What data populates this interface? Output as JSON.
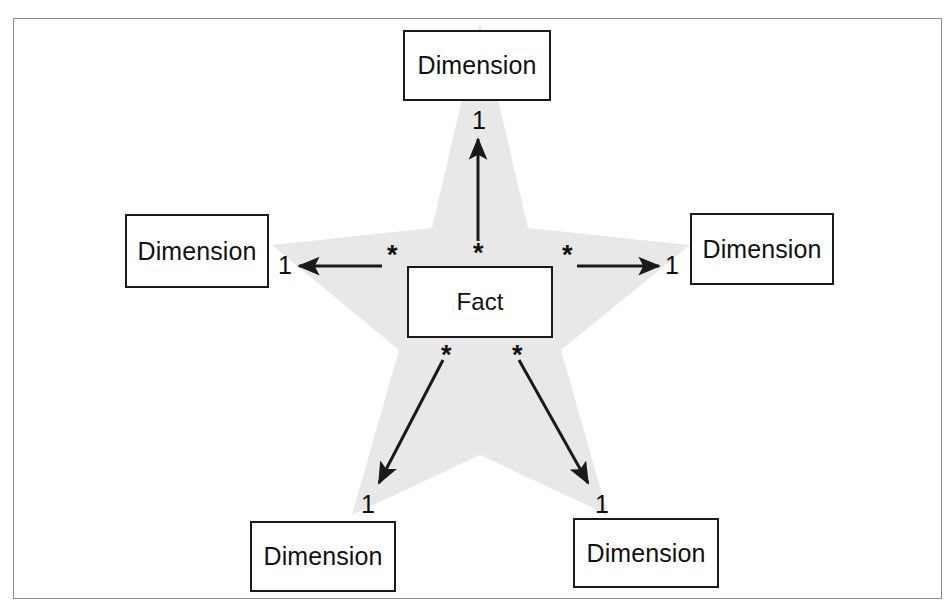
{
  "figure": {
    "background_color": "#ffffff",
    "frame_border_color": "#8d8d8d",
    "star_fill_color": "#e8e8e8",
    "line_color": "#1a1a1a",
    "box_border_color": "#1a1a1a",
    "box_fill_color": "#ffffff"
  },
  "nodes": {
    "fact": {
      "label": "Fact",
      "x": 407,
      "y": 266,
      "w": 146,
      "h": 72
    },
    "dimensions": [
      {
        "id": "dimension-top",
        "label": "Dimension",
        "x": 403,
        "y": 30,
        "w": 148,
        "h": 71
      },
      {
        "id": "dimension-left",
        "label": "Dimension",
        "x": 125,
        "y": 214,
        "w": 144,
        "h": 74
      },
      {
        "id": "dimension-right",
        "label": "Dimension",
        "x": 690,
        "y": 213,
        "w": 144,
        "h": 72
      },
      {
        "id": "dimension-bottom-left",
        "label": "Dimension",
        "x": 250,
        "y": 521,
        "w": 146,
        "h": 71
      },
      {
        "id": "dimension-bottom-right",
        "label": "Dimension",
        "x": 573,
        "y": 518,
        "w": 146,
        "h": 70
      }
    ]
  },
  "relationships": [
    {
      "id": "fact-to-dimension-top",
      "from": "fact",
      "to": "dimension-top",
      "many_label": "*",
      "one_label": "1",
      "many_pos": {
        "x": 478,
        "y": 250
      },
      "one_pos": {
        "x": 478,
        "y": 121
      }
    },
    {
      "id": "fact-to-dimension-left",
      "from": "fact",
      "to": "dimension-left",
      "many_label": "*",
      "one_label": "1",
      "many_pos": {
        "x": 392,
        "y": 252
      },
      "one_pos": {
        "x": 284,
        "y": 266
      }
    },
    {
      "id": "fact-to-dimension-right",
      "from": "fact",
      "to": "dimension-right",
      "many_label": "*",
      "one_label": "1",
      "many_pos": {
        "x": 567,
        "y": 252
      },
      "one_pos": {
        "x": 671,
        "y": 266
      }
    },
    {
      "id": "fact-to-dimension-bottom-left",
      "from": "fact",
      "to": "dimension-bottom-left",
      "many_label": "*",
      "one_label": "1",
      "many_pos": {
        "x": 446,
        "y": 352
      },
      "one_pos": {
        "x": 367,
        "y": 505
      }
    },
    {
      "id": "fact-to-dimension-bottom-right",
      "from": "fact",
      "to": "dimension-bottom-right",
      "many_label": "*",
      "one_label": "1",
      "many_pos": {
        "x": 517,
        "y": 352
      },
      "one_pos": {
        "x": 601,
        "y": 505
      }
    }
  ],
  "star_shape": {
    "points": "480,22 528,228 690,245 561,350 608,515 480,455 352,515 399,350 272,245 432,228"
  }
}
